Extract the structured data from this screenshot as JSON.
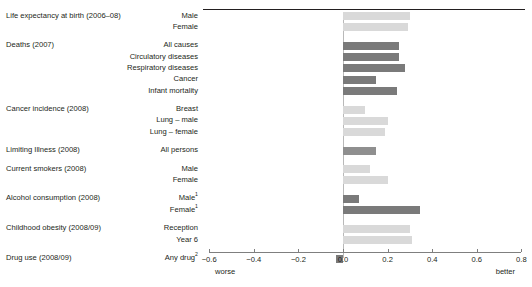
{
  "chart_data": {
    "type": "bar",
    "orientation": "horizontal",
    "title": "",
    "xlabel": "",
    "ylabel": "",
    "xlim": [
      -0.6,
      0.8
    ],
    "xticks": [
      -0.6,
      -0.4,
      -0.2,
      0.0,
      0.2,
      0.4,
      0.6,
      0.8
    ],
    "xtick_labels": [
      "−0.6",
      "−0.4",
      "−0.2",
      "0.0",
      "0.2",
      "0.4",
      "0.6",
      "0.8"
    ],
    "grid": false,
    "legend_position": "none",
    "axis_end_labels": {
      "left": "worse",
      "right": "better"
    },
    "zero_reference_line": true,
    "colors": {
      "light_grey": "#d9d9d9",
      "mid_grey": "#bfbfbf",
      "dark_grey": "#7a7a7a",
      "axis": "#7f7f7f",
      "rule": "#231f20",
      "text": "#231f20"
    },
    "groups": [
      {
        "title": "Life expectancy at birth (2006–08)",
        "bars": [
          {
            "label": "Male",
            "value": 0.3,
            "color": "#d9d9d9"
          },
          {
            "label": "Female",
            "value": 0.29,
            "color": "#d9d9d9"
          }
        ]
      },
      {
        "title": "Deaths (2007)",
        "bars": [
          {
            "label": "All causes",
            "value": 0.25,
            "color": "#7a7a7a"
          },
          {
            "label": "Circulatory diseases",
            "value": 0.25,
            "color": "#7a7a7a"
          },
          {
            "label": "Respiratory diseases",
            "value": 0.28,
            "color": "#7a7a7a"
          },
          {
            "label": "Cancer",
            "value": 0.15,
            "color": "#7a7a7a"
          },
          {
            "label": "Infant mortality",
            "value": 0.24,
            "color": "#7a7a7a"
          }
        ]
      },
      {
        "title": "Cancer incidence (2008)",
        "bars": [
          {
            "label": "Breast",
            "value": 0.1,
            "color": "#d9d9d9"
          },
          {
            "label": "Lung – male",
            "value": 0.2,
            "color": "#d9d9d9"
          },
          {
            "label": "Lung – female",
            "value": 0.19,
            "color": "#d9d9d9"
          }
        ]
      },
      {
        "title": "Limiting Illness (2008)",
        "bars": [
          {
            "label": "All persons",
            "value": 0.15,
            "color": "#8f8f8f"
          }
        ]
      },
      {
        "title": "Current smokers (2008)",
        "bars": [
          {
            "label": "Male",
            "value": 0.12,
            "color": "#d9d9d9"
          },
          {
            "label": "Female",
            "value": 0.2,
            "color": "#d9d9d9"
          }
        ]
      },
      {
        "title": "Alcohol consumption (2008)",
        "bars": [
          {
            "label": "Male",
            "label_sup": "1",
            "value": 0.07,
            "color": "#7a7a7a"
          },
          {
            "label": "Female",
            "label_sup": "1",
            "value": 0.345,
            "color": "#7a7a7a"
          }
        ]
      },
      {
        "title": "Childhood obesity (2008/09)",
        "bars": [
          {
            "label": "Reception",
            "value": 0.3,
            "color": "#d9d9d9"
          },
          {
            "label": "Year 6",
            "value": 0.31,
            "color": "#d9d9d9"
          }
        ]
      },
      {
        "title": "Drug use (2008/09)",
        "bars": [
          {
            "label": "Any drug",
            "label_sup": "2",
            "value": -0.03,
            "color": "#7a7a7a"
          }
        ]
      }
    ]
  }
}
